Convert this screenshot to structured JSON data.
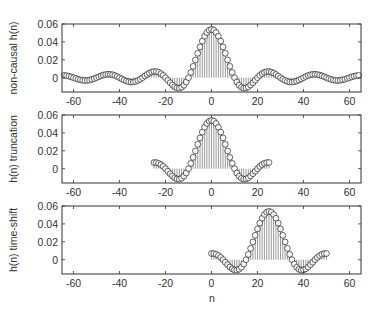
{
  "figure": {
    "xlabel": "n",
    "panels": [
      {
        "ylabel": "non-causal h(n)",
        "n_start": -64,
        "n_end": 64,
        "shift": 0
      },
      {
        "ylabel": "h(n) truncation",
        "n_start": -25,
        "n_end": 25,
        "shift": 0
      },
      {
        "ylabel": "h(n) time-shift",
        "n_start": -25,
        "n_end": 25,
        "shift": 25
      }
    ],
    "xticks": [
      -60,
      -40,
      -20,
      0,
      20,
      40,
      60
    ],
    "yticks": [
      0,
      0.02,
      0.04,
      0.06
    ],
    "ytick_labels": [
      "0",
      "0.02",
      "0.04",
      "0.06"
    ],
    "xlim": [
      -65,
      65
    ],
    "ylim": [
      -0.016,
      0.06
    ],
    "colors": {
      "stem": "#555555",
      "marker_edge": "#222222",
      "axes": "#333333"
    }
  },
  "chart_data": [
    {
      "type": "scatter",
      "style": "stem",
      "title": "",
      "xlabel": "n",
      "ylabel": "non-causal h(n)",
      "xlim": [
        -65,
        65
      ],
      "ylim": [
        -0.016,
        0.06
      ],
      "description": "Ideal lowpass impulse response (sinc), h(n) ≈ 0.054·sin(πn/10)/(πn/10), n = -64..64",
      "x_range": [
        -64,
        64
      ],
      "peak": {
        "x": 0,
        "y": 0.054
      },
      "key_points": [
        {
          "x": -45,
          "y": 0.007
        },
        {
          "x": -35,
          "y": -0.002
        },
        {
          "x": -24,
          "y": 0.009
        },
        {
          "x": -14,
          "y": -0.009
        },
        {
          "x": -10,
          "y": 0.0
        },
        {
          "x": 0,
          "y": 0.054
        },
        {
          "x": 10,
          "y": 0.0
        },
        {
          "x": 14,
          "y": -0.009
        },
        {
          "x": 24,
          "y": 0.009
        },
        {
          "x": 35,
          "y": -0.002
        },
        {
          "x": 45,
          "y": 0.007
        }
      ]
    },
    {
      "type": "scatter",
      "style": "stem",
      "xlabel": "n",
      "ylabel": "h(n) truncation",
      "xlim": [
        -65,
        65
      ],
      "ylim": [
        -0.016,
        0.06
      ],
      "description": "Truncated impulse response, n = -25..25",
      "x_range": [
        -25,
        25
      ],
      "peak": {
        "x": 0,
        "y": 0.054
      },
      "key_points": [
        {
          "x": -25,
          "y": 0.009
        },
        {
          "x": -14,
          "y": -0.009
        },
        {
          "x": 0,
          "y": 0.054
        },
        {
          "x": 14,
          "y": -0.009
        },
        {
          "x": 25,
          "y": 0.009
        }
      ]
    },
    {
      "type": "scatter",
      "style": "stem",
      "xlabel": "n",
      "ylabel": "h(n) time-shift",
      "xlim": [
        -65,
        65
      ],
      "ylim": [
        -0.016,
        0.06
      ],
      "description": "Truncated response shifted by 25 samples, n = 0..50",
      "x_range": [
        0,
        50
      ],
      "peak": {
        "x": 25,
        "y": 0.054
      },
      "key_points": [
        {
          "x": 0,
          "y": 0.009
        },
        {
          "x": 11,
          "y": -0.009
        },
        {
          "x": 25,
          "y": 0.054
        },
        {
          "x": 39,
          "y": -0.009
        },
        {
          "x": 50,
          "y": 0.009
        }
      ]
    }
  ]
}
